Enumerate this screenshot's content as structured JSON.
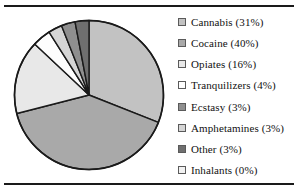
{
  "figure": {
    "top_rule": "horizontal-rule",
    "bottom_rule": "horizontal-rule"
  },
  "chart_data": {
    "type": "pie",
    "title": "",
    "subtitle": "",
    "xlabel": "",
    "ylabel": "",
    "grid": false,
    "legend_position": "right",
    "start_angle_deg": 0,
    "direction": "clockwise",
    "categories": [
      "Cannabis",
      "Cocaine",
      "Opiates",
      "Tranquilizers",
      "Ecstasy",
      "Amphetamines",
      "Other",
      "Inhalants"
    ],
    "values": [
      31,
      40,
      16,
      4,
      3,
      3,
      3,
      0
    ],
    "unit": "%",
    "colors": [
      "#c2c2c2",
      "#a9a9a9",
      "#e8e8e8",
      "#fdfdfd",
      "#8f8f8f",
      "#d5d5d5",
      "#6f6f6f",
      "#f2f2f2"
    ],
    "slice_draw_order": [
      "Cannabis",
      "Cocaine",
      "Opiates",
      "Tranquilizers",
      "Amphetamines",
      "Ecstasy",
      "Other"
    ],
    "slice_outline_color": "#1a1a1a",
    "legend_entries": [
      {
        "label": "Cannabis (31%)",
        "color": "#c2c2c2"
      },
      {
        "label": "Cocaine (40%)",
        "color": "#a9a9a9"
      },
      {
        "label": "Opiates (16%)",
        "color": "#e8e8e8"
      },
      {
        "label": "Tranquilizers (4%)",
        "color": "#fdfdfd"
      },
      {
        "label": "Ecstasy (3%)",
        "color": "#8f8f8f"
      },
      {
        "label": "Amphetamines (3%)",
        "color": "#d5d5d5"
      },
      {
        "label": "Other (3%)",
        "color": "#6f6f6f"
      },
      {
        "label": "Inhalants (0%)",
        "color": "#f2f2f2"
      }
    ]
  }
}
